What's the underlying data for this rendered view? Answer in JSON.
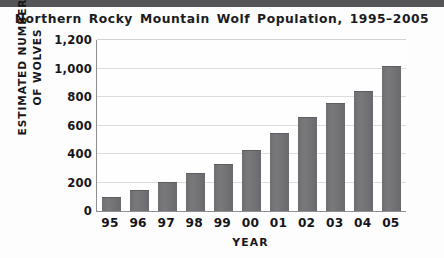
{
  "chart_data": {
    "type": "bar",
    "title": "Northern Rocky Mountain Wolf Population, 1995–2005",
    "xlabel": "YEAR",
    "ylabel": "ESTIMATED NUMBER OF WOLVES",
    "ylabel_line1": "ESTIMATED NUMBER",
    "ylabel_line2": "OF WOLVES",
    "categories": [
      "95",
      "96",
      "97",
      "98",
      "99",
      "00",
      "01",
      "02",
      "03",
      "04",
      "05"
    ],
    "values": [
      100,
      150,
      205,
      270,
      330,
      425,
      550,
      660,
      755,
      845,
      1020
    ],
    "ylim": [
      0,
      1200
    ],
    "ytick_values": [
      0,
      200,
      400,
      600,
      800,
      1000,
      1200
    ],
    "ytick_labels": [
      "0",
      "200",
      "400",
      "600",
      "800",
      "1,000",
      "1,200"
    ],
    "grid": "horizontal",
    "legend": "none",
    "bar_color": "#6f6f72",
    "grid_color": "#dcdcdf",
    "axis_color": "#8e8e92",
    "text_color": "#16161a",
    "background": "#fdfdfd"
  }
}
